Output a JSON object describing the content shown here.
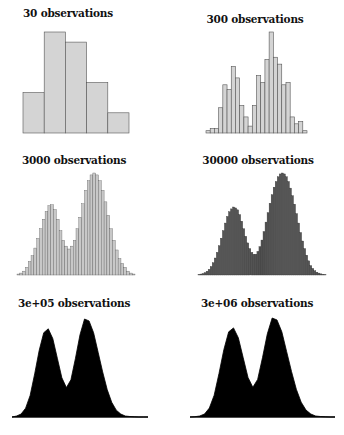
{
  "chart_data": [
    {
      "type": "bar",
      "title": "30 observations",
      "xlabel": "",
      "ylabel": "",
      "grid": false,
      "values": [
        4,
        10,
        9,
        5,
        2
      ],
      "style": {
        "fill": "#d4d4d4",
        "stroke": "#555555"
      },
      "layout": {
        "x0": 23,
        "x1": 129,
        "base": 133,
        "top": 32,
        "title_x": 68,
        "title_y": 13
      }
    },
    {
      "type": "bar",
      "title": "300 observations",
      "xlabel": "",
      "ylabel": "",
      "grid": false,
      "values": [
        1,
        2,
        2,
        11,
        21,
        19,
        29,
        24,
        12,
        7,
        3,
        12,
        25,
        22,
        32,
        44,
        33,
        30,
        21,
        22,
        7,
        4,
        5,
        1
      ],
      "style": {
        "fill": "#d4d4d4",
        "stroke": "#555555"
      },
      "layout": {
        "x0": 206,
        "x1": 307,
        "base": 133,
        "top": 32,
        "title_x": 255,
        "title_y": 19
      }
    },
    {
      "type": "bar",
      "title": "3000 observations",
      "xlabel": "",
      "ylabel": "",
      "grid": false,
      "values": [
        1,
        2,
        4,
        8,
        14,
        20,
        28,
        38,
        48,
        58,
        66,
        72,
        73,
        68,
        58,
        46,
        36,
        30,
        27,
        30,
        36,
        48,
        60,
        74,
        88,
        98,
        104,
        106,
        104,
        98,
        88,
        76,
        62,
        48,
        36,
        26,
        17,
        12,
        8,
        4,
        2,
        1
      ],
      "style": {
        "fill": "#c8c8c8",
        "stroke": "#555555"
      },
      "layout": {
        "x0": 17,
        "x1": 135,
        "base": 275,
        "top": 173,
        "title_x": 74,
        "title_y": 160
      }
    },
    {
      "type": "bar",
      "title": "30000 observations",
      "xlabel": "",
      "ylabel": "",
      "grid": false,
      "values": [
        0.5,
        1,
        1.5,
        2.5,
        4,
        6,
        9,
        13,
        18,
        24,
        31,
        39,
        47,
        55,
        62,
        67,
        70,
        72,
        71,
        69,
        64,
        57,
        49,
        41,
        34,
        28,
        24,
        22,
        22,
        25,
        30,
        37,
        46,
        56,
        66,
        76,
        85,
        93,
        99,
        104,
        107,
        108,
        107,
        104,
        99,
        92,
        84,
        75,
        65,
        55,
        45,
        36,
        28,
        21,
        15,
        10,
        7,
        4.5,
        3,
        2,
        1.2,
        0.7,
        0.4
      ],
      "style": {
        "fill": "#555555",
        "stroke": "#333333"
      },
      "layout": {
        "x0": 198,
        "x1": 326,
        "base": 275,
        "top": 173,
        "title_x": 258,
        "title_y": 160
      }
    },
    {
      "type": "area",
      "title": "3e+05 observations",
      "xlabel": "",
      "ylabel": "",
      "grid": false,
      "x": [
        0,
        5,
        10,
        15,
        20,
        25,
        30,
        35,
        40,
        45,
        50,
        55,
        60,
        65,
        70,
        75,
        80,
        85,
        90,
        95,
        100,
        105,
        110,
        115,
        120,
        125,
        130,
        135,
        140,
        145,
        150
      ],
      "values": [
        0,
        1,
        3,
        9,
        22,
        44,
        68,
        86,
        90,
        80,
        60,
        40,
        30,
        38,
        60,
        84,
        100,
        98,
        86,
        66,
        46,
        28,
        15,
        7,
        3,
        1,
        0.5,
        0.2,
        0,
        0,
        0
      ],
      "style": {
        "fill": "#000000",
        "stroke": "#000000"
      },
      "layout": {
        "x0": 12,
        "x1": 148,
        "base": 417,
        "top": 319,
        "title_x": 74,
        "title_y": 303
      }
    },
    {
      "type": "area",
      "title": "3e+06 observations",
      "xlabel": "",
      "ylabel": "",
      "grid": false,
      "x": [
        0,
        5,
        10,
        15,
        20,
        25,
        30,
        35,
        40,
        45,
        50,
        55,
        60,
        65,
        70,
        75,
        80,
        85,
        90,
        95,
        100,
        105,
        110,
        115,
        120,
        125,
        130,
        135,
        140,
        145,
        150
      ],
      "values": [
        0,
        0.3,
        1,
        3,
        9,
        22,
        44,
        68,
        86,
        90,
        80,
        60,
        40,
        30,
        38,
        60,
        84,
        100,
        98,
        86,
        66,
        46,
        28,
        15,
        7,
        3,
        1,
        0.5,
        0.2,
        0,
        0
      ],
      "style": {
        "fill": "#000000",
        "stroke": "#000000"
      },
      "layout": {
        "x0": 190,
        "x1": 335,
        "base": 417,
        "top": 318,
        "title_x": 257,
        "title_y": 303
      }
    }
  ]
}
